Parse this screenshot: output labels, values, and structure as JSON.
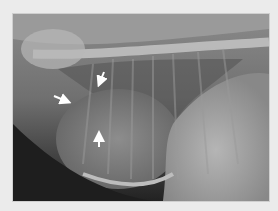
{
  "image": {
    "kind": "lateral thoracic radiograph",
    "background_color": "#ebebeb",
    "arrows": [
      {
        "name": "arrow-top",
        "direction": "down-left",
        "color": "#ffffff"
      },
      {
        "name": "arrow-left",
        "direction": "right",
        "color": "#ffffff"
      },
      {
        "name": "arrow-bottom",
        "direction": "up",
        "color": "#ffffff"
      }
    ]
  }
}
